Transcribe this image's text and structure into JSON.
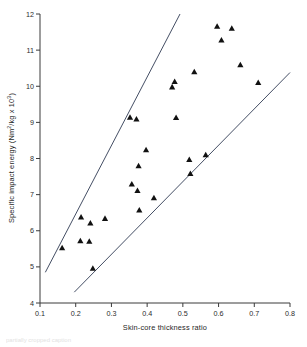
{
  "figure": {
    "background_color": "#ffffff",
    "marker_color": "#111111",
    "line_color": "#2f3a52",
    "axis_color": "#3a3a3a",
    "caption_partial": "partially cropped caption"
  },
  "chart_data": {
    "type": "scatter",
    "title": "",
    "xlabel": "Skin-core thickness ratio",
    "ylabel_main": "Specific impact energy (Nm",
    "ylabel_sup1": "2",
    "ylabel_mid": "/kg  x 10",
    "ylabel_sup2": "3",
    "ylabel_end": ")",
    "ylabel_full": "Specific impact energy (Nm2/kg x 103)",
    "xlim": [
      0.1,
      0.8
    ],
    "ylim": [
      4,
      12
    ],
    "xticks": [
      0.1,
      0.2,
      0.3,
      0.4,
      0.5,
      0.6,
      0.7,
      0.8
    ],
    "xtick_labels": [
      "0.1",
      "0.2",
      "0.3",
      "0.4",
      "0.5",
      "0.6",
      "0.7",
      "0.8"
    ],
    "yticks": [
      4,
      5,
      6,
      7,
      8,
      9,
      10,
      11,
      12
    ],
    "ytick_labels": [
      "4",
      "5",
      "6",
      "7",
      "8",
      "9",
      "10",
      "11",
      "12"
    ],
    "grid": false,
    "legend": null,
    "marker": "triangle-up",
    "points": [
      {
        "x": 0.162,
        "y": 5.53
      },
      {
        "x": 0.213,
        "y": 5.72
      },
      {
        "x": 0.215,
        "y": 6.38
      },
      {
        "x": 0.238,
        "y": 5.71
      },
      {
        "x": 0.241,
        "y": 6.21
      },
      {
        "x": 0.248,
        "y": 4.96
      },
      {
        "x": 0.282,
        "y": 6.34
      },
      {
        "x": 0.352,
        "y": 9.14
      },
      {
        "x": 0.357,
        "y": 7.29
      },
      {
        "x": 0.37,
        "y": 9.09
      },
      {
        "x": 0.373,
        "y": 7.11
      },
      {
        "x": 0.376,
        "y": 7.8
      },
      {
        "x": 0.378,
        "y": 6.57
      },
      {
        "x": 0.397,
        "y": 8.24
      },
      {
        "x": 0.419,
        "y": 6.91
      },
      {
        "x": 0.47,
        "y": 9.98
      },
      {
        "x": 0.477,
        "y": 10.13
      },
      {
        "x": 0.481,
        "y": 9.13
      },
      {
        "x": 0.518,
        "y": 7.97
      },
      {
        "x": 0.521,
        "y": 7.58
      },
      {
        "x": 0.532,
        "y": 10.4
      },
      {
        "x": 0.564,
        "y": 8.1
      },
      {
        "x": 0.596,
        "y": 11.66
      },
      {
        "x": 0.608,
        "y": 11.28
      },
      {
        "x": 0.637,
        "y": 11.6
      },
      {
        "x": 0.661,
        "y": 10.59
      },
      {
        "x": 0.711,
        "y": 10.1
      }
    ],
    "boundary_lines": [
      {
        "name": "upper-bound-line",
        "x1": 0.115,
        "y1": 4.85,
        "x2": 0.492,
        "y2": 12.0
      },
      {
        "name": "lower-bound-line",
        "x1": 0.196,
        "y1": 4.3,
        "x2": 0.8,
        "y2": 10.38
      }
    ]
  }
}
